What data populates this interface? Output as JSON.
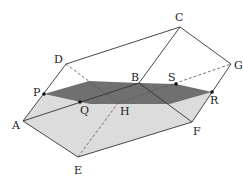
{
  "figure": {
    "colors": {
      "section": "#707070",
      "lower_face": "#dcdcdc",
      "edge": "#333333",
      "hidden_edge": "#555555",
      "point": "#111111"
    },
    "labels": {
      "A": "A",
      "B": "B",
      "C": "C",
      "D": "D",
      "E": "E",
      "F": "F",
      "G": "G",
      "H": "H",
      "P": "P",
      "Q": "Q",
      "R": "R",
      "S": "S"
    }
  }
}
